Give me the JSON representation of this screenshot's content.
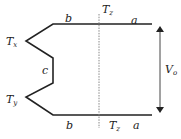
{
  "diagram": {
    "type": "circuit-path-diagram",
    "labels": {
      "top_left_segment": "b",
      "top_right_segment": "a",
      "bottom_left_segment": "b",
      "bottom_right_segment": "a",
      "middle_segment": "c",
      "top_dashed_label": {
        "base": "T",
        "sub": "z"
      },
      "bottom_dashed_label": {
        "base": "T",
        "sub": "z"
      },
      "upper_vertex": {
        "base": "T",
        "sub": "x"
      },
      "lower_vertex": {
        "base": "T",
        "sub": "y"
      },
      "voltage": {
        "base": "V",
        "sub": "o"
      }
    },
    "colors": {
      "line": "#222222",
      "dashed": "#888888",
      "background": "#ffffff"
    }
  }
}
